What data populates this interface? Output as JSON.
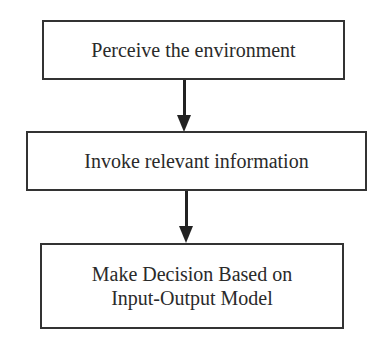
{
  "diagram": {
    "type": "flowchart",
    "direction": "top-to-bottom",
    "nodes": [
      {
        "id": "step-1",
        "label": "Perceive the environment"
      },
      {
        "id": "step-2",
        "label": "Invoke relevant information"
      },
      {
        "id": "step-3",
        "label": "Make Decision Based on\nInput-Output Model"
      }
    ],
    "edges": [
      {
        "from": "step-1",
        "to": "step-2"
      },
      {
        "from": "step-2",
        "to": "step-3"
      }
    ],
    "colors": {
      "border": "#333333",
      "text": "#2a2a2a",
      "arrow": "#222222",
      "background": "#ffffff"
    }
  }
}
